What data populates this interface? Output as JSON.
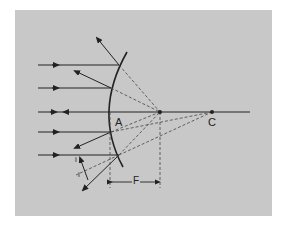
{
  "diagram": {
    "type": "convex-mirror-ray-diagram",
    "colors": {
      "background": "#ffffff",
      "panel": "#c8c8c8",
      "ink": "#222222"
    },
    "labels": {
      "vertex": "A",
      "center_of_curvature": "C",
      "focal_length": "F",
      "angle_incidence": "i",
      "angle_reflection": "i"
    },
    "points": {
      "vertex_A": [
        110,
        112
      ],
      "focus_F": [
        160,
        112
      ],
      "center_C": [
        212,
        112
      ]
    },
    "incident_rays_y": [
      65,
      88,
      112,
      132,
      155
    ]
  }
}
